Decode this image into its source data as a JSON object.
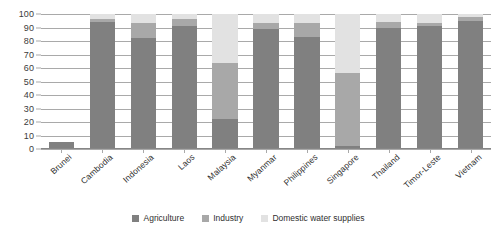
{
  "chart_data": {
    "type": "bar",
    "subtype": "stacked-bar-100-percent",
    "title": "",
    "xlabel": "",
    "ylabel": "",
    "ylim": [
      0,
      100
    ],
    "yticks": [
      0,
      10,
      20,
      30,
      40,
      50,
      60,
      70,
      80,
      90,
      100
    ],
    "grid": true,
    "legend_position": "bottom",
    "categories": [
      "Brunei",
      "Cambodia",
      "Indonesia",
      "Laos",
      "Malaysia",
      "Myanmar",
      "Philippines",
      "Singapore",
      "Thailand",
      "Timor-Leste",
      "Vietnam"
    ],
    "series": [
      {
        "name": "Agriculture",
        "color": "#808080",
        "values": [
          5,
          94,
          82,
          91,
          22,
          89,
          83,
          2,
          90,
          91,
          95
        ]
      },
      {
        "name": "Industry",
        "color": "#a8a8a8",
        "values": [
          0,
          2,
          11,
          5,
          42,
          4,
          10,
          54,
          4,
          2,
          3
        ]
      },
      {
        "name": "Domestic water supplies",
        "color": "#e2e2e2",
        "values": [
          0,
          4,
          7,
          4,
          36,
          7,
          7,
          44,
          6,
          7,
          2
        ]
      }
    ]
  },
  "legend": {
    "items": [
      {
        "label": "Agriculture",
        "color": "#808080",
        "swatch_name": "legend-swatch-agriculture"
      },
      {
        "label": "Industry",
        "color": "#a8a8a8",
        "swatch_name": "legend-swatch-industry"
      },
      {
        "label": "Domestic water supplies",
        "color": "#e2e2e2",
        "swatch_name": "legend-swatch-domestic-water-supplies"
      }
    ]
  }
}
